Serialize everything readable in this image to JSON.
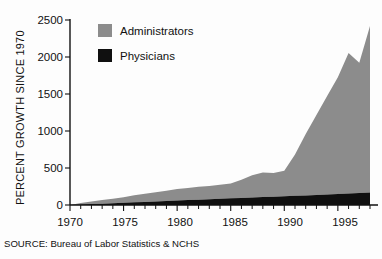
{
  "chart_data": {
    "type": "area",
    "subtype": "stacked-area",
    "title": "",
    "xlabel": "",
    "ylabel": "PERCENT GROWTH SINCE 1970",
    "xlim": [
      1970,
      1998
    ],
    "ylim": [
      0,
      2500
    ],
    "ytick_values": [
      0,
      500,
      1000,
      1500,
      2000,
      2500
    ],
    "ytick_labels": [
      "0",
      "500",
      "1000",
      "1500",
      "2000",
      "2500"
    ],
    "xtick_values": [
      1970,
      1975,
      1980,
      1985,
      1990,
      1995
    ],
    "xtick_labels": [
      "1970",
      "1975",
      "1980",
      "1985",
      "1990",
      "1995"
    ],
    "xtick_minor_interval": 1,
    "grid": false,
    "legend_position": "top-left-inside",
    "x": [
      1970,
      1971,
      1972,
      1973,
      1974,
      1975,
      1976,
      1977,
      1978,
      1979,
      1980,
      1981,
      1982,
      1983,
      1984,
      1985,
      1986,
      1987,
      1988,
      1989,
      1990,
      1991,
      1992,
      1993,
      1994,
      1995,
      1996,
      1997,
      1998
    ],
    "series": [
      {
        "name": "Administrators",
        "color": "#8c8c8c",
        "values": [
          0,
          20,
          35,
          50,
          62,
          75,
          95,
          110,
          125,
          140,
          155,
          165,
          175,
          180,
          190,
          200,
          245,
          300,
          330,
          320,
          345,
          560,
          830,
          1080,
          1330,
          1580,
          1900,
          1760,
          2250
        ]
      },
      {
        "name": "Physicians",
        "color": "#101010",
        "values": [
          0,
          6,
          12,
          18,
          24,
          30,
          36,
          42,
          48,
          54,
          60,
          66,
          72,
          78,
          84,
          90,
          96,
          102,
          108,
          112,
          118,
          124,
          130,
          136,
          142,
          148,
          155,
          162,
          170
        ]
      }
    ],
    "annotations": [
      {
        "name": "source-note",
        "text": "SOURCE: Bureau of Labor Statistics & NCHS"
      }
    ]
  },
  "legend": {
    "items": [
      {
        "label": "Administrators",
        "swatch": "#8c8c8c"
      },
      {
        "label": "Physicians",
        "swatch": "#101010"
      }
    ]
  },
  "axes": {
    "y_title": "PERCENT GROWTH SINCE 1970",
    "y_ticks": [
      "2500",
      "2000",
      "1500",
      "1000",
      "500",
      "0"
    ],
    "x_ticks": [
      "1970",
      "1975",
      "1980",
      "1985",
      "1990",
      "1995"
    ]
  },
  "source": {
    "text": "SOURCE: Bureau of Labor Statistics & NCHS"
  }
}
